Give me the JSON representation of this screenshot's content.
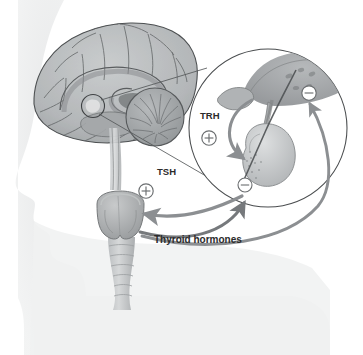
{
  "figure": {
    "background_color": "#ffffff",
    "width": 363,
    "height": 355
  },
  "labels": {
    "trh": "TRH",
    "tsh": "TSH",
    "thyroid_hormones": "Thyroid hormones"
  },
  "signs": {
    "plus": "+",
    "minus": "−",
    "trh_sign": "+",
    "tsh_sign": "+",
    "hypothalamus_feedback_sign": "−",
    "pituitary_feedback_sign": "−"
  },
  "anatomy": {
    "head_silhouette": "head-profile",
    "brain": "sagittal-brain",
    "cerebellum": "cerebellum",
    "corpus_callosum": "corpus-callosum",
    "brainstem": "brainstem",
    "hypothalamus": "hypothalamus",
    "pituitary": "pituitary-gland",
    "pituitary_stalk": "infundibulum",
    "thyroid": "thyroid-gland",
    "trachea": "trachea",
    "magnifier": "magnified-inset-circle",
    "callout_circle": "brain-callout-circle"
  },
  "colors": {
    "silhouette": "#ebeced",
    "brain_fill": "#b9bcbd",
    "brain_line": "#4d5052",
    "cerebellum": "#a8abad",
    "inset_fill": "#cfd1d2",
    "arrow": "#939699",
    "arrow_dark": "#6f7376",
    "text": "#2b2b2b",
    "sign_stroke": "#6b6e70",
    "leader_line": "#55585a"
  }
}
